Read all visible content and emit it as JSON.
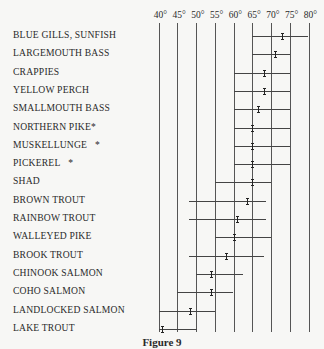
{
  "chart_data": {
    "type": "range",
    "title": "",
    "caption": "Figure 9",
    "xlabel": "Temperature (°F)",
    "ylabel": "",
    "xlim": [
      40,
      80
    ],
    "grid": true,
    "x_ticks": [
      "40°",
      "45°",
      "50°",
      "55°",
      "60°",
      "65°",
      "70°",
      "75°",
      "80°"
    ],
    "categories": [
      "BLUE GILLS, SUNFISH",
      "LARGEMOUTH BASS",
      "CRAPPIES",
      "YELLOW PERCH",
      "SMALLMOUTH BASS",
      "NORTHERN PIKE*",
      "MUSKELLUNGE  *",
      "PICKEREL        *",
      "SHAD",
      "BROWN TROUT",
      "RAINBOW TROUT",
      "WALLEYED PIKE",
      "BROOK TROUT",
      "CHINOOK SALMON",
      "COHO SALMON",
      "LANDLOCKED SALMON",
      "LAKE TROUT"
    ],
    "series": [
      {
        "name": "range_low",
        "values": [
          65,
          65,
          60,
          60,
          60,
          60,
          60,
          60,
          55,
          48,
          48,
          55,
          48,
          50,
          45,
          40,
          40
        ]
      },
      {
        "name": "range_high",
        "values": [
          80,
          75,
          75,
          75,
          75,
          75,
          75,
          75,
          70,
          68.5,
          68.5,
          70,
          68,
          62.5,
          60,
          55,
          50
        ]
      },
      {
        "name": "preferred",
        "values": [
          73,
          71,
          68,
          68,
          66.5,
          65,
          65,
          65,
          65,
          63.5,
          61,
          60,
          58,
          54,
          54,
          48.5,
          41
        ]
      }
    ]
  }
}
